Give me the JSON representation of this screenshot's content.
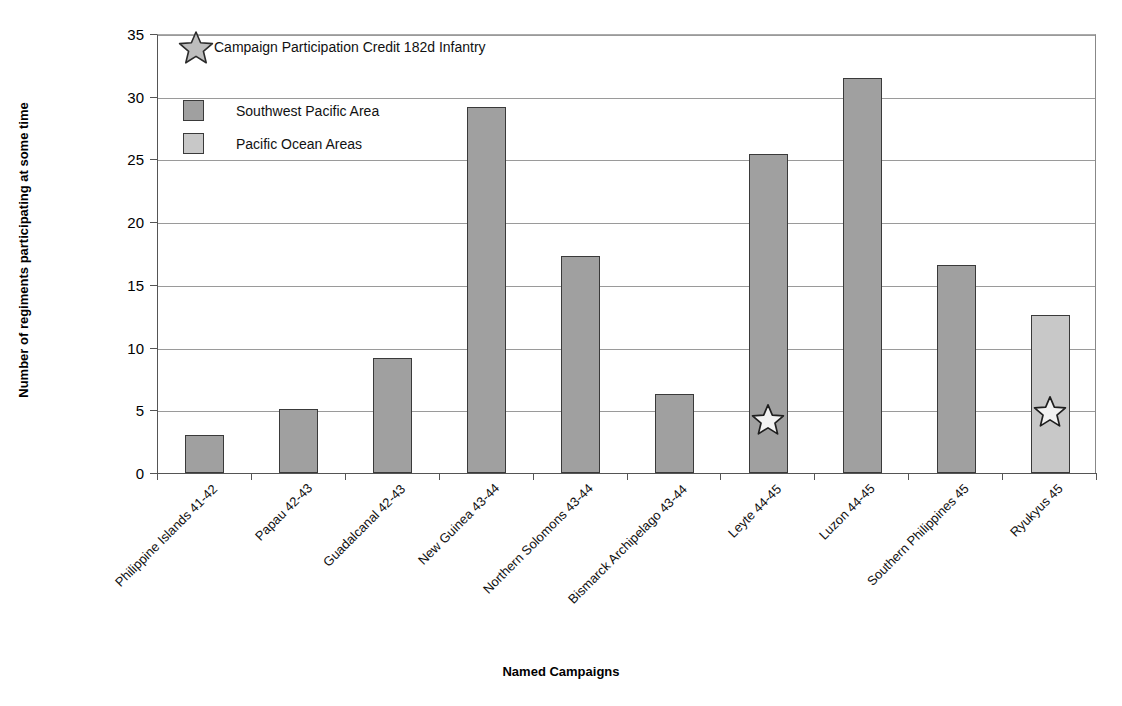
{
  "chart_data": {
    "type": "bar",
    "title": "",
    "xlabel": "Named Campaigns",
    "ylabel": "Number of regiments participating at some time",
    "ylim": [
      0,
      35
    ],
    "ytick_step": 5,
    "yticks": [
      "0",
      "5",
      "10",
      "15",
      "20",
      "25",
      "30",
      "35"
    ],
    "grid": true,
    "legend_position": "upper-left-inside",
    "categories": [
      "Philippine Islands 41-42",
      "Papau 42-43",
      "Guadalcanal 42-43",
      "New Guinea 43-44",
      "Northern Solomons 43-44",
      "Bismarck Archipelago 43-44",
      "Leyte 44-45",
      "Luzon 44-45",
      "Southern Philippines 45",
      "Ryukyus 45"
    ],
    "values": [
      3.0,
      5.1,
      9.2,
      29.2,
      17.3,
      6.3,
      25.4,
      31.5,
      16.6,
      12.6
    ],
    "series_of_bar": [
      "Southwest Pacific Area",
      "Southwest Pacific Area",
      "Southwest Pacific Area",
      "Southwest Pacific Area",
      "Southwest Pacific Area",
      "Southwest Pacific Area",
      "Southwest Pacific Area",
      "Southwest Pacific Area",
      "Southwest Pacific Area",
      "Pacific Ocean Areas"
    ],
    "series": [
      {
        "name": "Southwest Pacific Area",
        "color": "#a0a0a0"
      },
      {
        "name": "Pacific Ocean Areas",
        "color": "#c8c8c8"
      }
    ],
    "annotations": [
      {
        "name": "campaign-participation-star",
        "category": "Leyte 44-45",
        "value": 4.2,
        "marker": "star"
      },
      {
        "name": "campaign-participation-star",
        "category": "Ryukyus 45",
        "value": 4.9,
        "marker": "star"
      }
    ]
  },
  "legend": {
    "star_entry": "Campaign Participation Credit 182d Infantry",
    "entries": [
      {
        "label": "Southwest Pacific Area",
        "color": "#a0a0a0"
      },
      {
        "label": "Pacific Ocean Areas",
        "color": "#c8c8c8"
      }
    ]
  },
  "axes": {
    "x_title": "Named Campaigns",
    "y_title": "Number of regiments participating at some time"
  }
}
